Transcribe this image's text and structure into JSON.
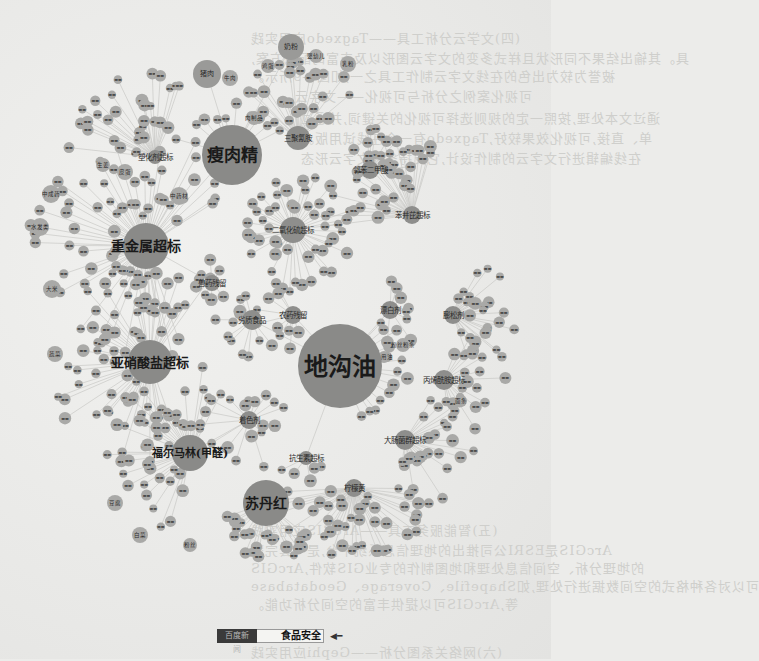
{
  "page": {
    "type": "scanned book page with food-safety keyword network graph",
    "background_color": "#ececea",
    "node_color": "#a9a9a7",
    "hub_color": "#8e8e8c",
    "edge_color": "#c9c9c6"
  },
  "bleed_through": {
    "note": "mirrored text from reverse side of the page",
    "lines": [
      {
        "text": "(四)文学云分析工具——Tagxedo应用实践",
        "x": 250,
        "y": 38
      },
      {
        "text": "具。其输出结果不同形状且样式多变的文字云图形以及丰富的配色方案,",
        "x": 250,
        "y": 58
      },
      {
        "text": "被誉为较为出色的在线文字云制作工具之一,如图1-9所示。",
        "x": 250,
        "y": 76
      },
      {
        "text": "可视化案例之分析与可视化——文字云。",
        "x": 280,
        "y": 96
      },
      {
        "text": "通过文本处理,按照一定的规则选择可视化的关键词,并通过",
        "x": 300,
        "y": 118
      },
      {
        "text": "单、直接,可视化效果较好,Tagxedo有一个在线试用版。",
        "x": 300,
        "y": 138
      },
      {
        "text": "在线编辑进行文字云的制作设计,它支持多种文字云形态",
        "x": 300,
        "y": 158
      },
      {
        "text": "(五)智能服务工具——ArcGIS应用实践",
        "x": 250,
        "y": 530
      },
      {
        "text": "ArcGIS是ESRI公司推出的地理信息系统平台,是一套完整",
        "x": 250,
        "y": 550
      },
      {
        "text": "的地理分析、空间信息处理和地图制作的专业GIS软件,ArcGIS",
        "x": 250,
        "y": 568
      },
      {
        "text": "可以对各种格式的空间数据进行处理,如Shapefile、Coverage、Geodatabase",
        "x": 250,
        "y": 586
      },
      {
        "text": "等,ArcGIS可以提供丰富的空间分析功能。",
        "x": 250,
        "y": 604
      },
      {
        "text": "(六)网络关系图分析——Gephi应用实践",
        "x": 250,
        "y": 652
      }
    ]
  },
  "graph": {
    "title_keyword": "食品安全",
    "hubs": [
      {
        "id": "dgy",
        "label": "地沟油",
        "x": 340,
        "y": 366,
        "r": 42,
        "size": "big",
        "font": 24
      },
      {
        "id": "srj",
        "label": "瘦肉精",
        "x": 232,
        "y": 155,
        "r": 30,
        "size": "big",
        "font": 17
      },
      {
        "id": "zjs",
        "label": "重金属超标",
        "x": 146,
        "y": 246,
        "r": 23,
        "size": "big",
        "font": 14
      },
      {
        "id": "xsy",
        "label": "亚硝酸盐超标",
        "x": 150,
        "y": 362,
        "r": 22,
        "size": "big",
        "font": 13
      },
      {
        "id": "fem",
        "label": "福尔马林(甲醛)",
        "x": 190,
        "y": 453,
        "r": 18,
        "size": "big",
        "font": 11
      },
      {
        "id": "sdh",
        "label": "苏丹红",
        "x": 266,
        "y": 503,
        "r": 23,
        "size": "big",
        "font": 14
      },
      {
        "id": "nf",
        "label": "奶粉",
        "x": 291,
        "y": 47,
        "r": 13,
        "size": "mid",
        "font": 8
      },
      {
        "id": "zr",
        "label": "猪肉",
        "x": 207,
        "y": 74,
        "r": 14,
        "size": "mid",
        "font": 8
      },
      {
        "id": "sjqa",
        "label": "三聚氰胺",
        "x": 298,
        "y": 138,
        "r": 12,
        "size": "hub",
        "font": 6
      },
      {
        "id": "eyh",
        "label": "二氧化硫超标",
        "x": 293,
        "y": 230,
        "r": 13,
        "size": "hub",
        "font": 6
      },
      {
        "id": "ptt",
        "label": "塑化剂超标",
        "x": 155,
        "y": 157,
        "r": 7,
        "size": "hub",
        "font": 4
      },
      {
        "id": "nng",
        "label": "邻苯二甲酸",
        "x": 370,
        "y": 170,
        "r": 9,
        "size": "hub",
        "font": 4
      },
      {
        "id": "bcj",
        "label": "苯并芘超标",
        "x": 412,
        "y": 215,
        "r": 9,
        "size": "hub",
        "font": 4
      },
      {
        "id": "jyd",
        "label": "劣质食品",
        "x": 252,
        "y": 320,
        "r": 10,
        "size": "hub",
        "font": 5
      },
      {
        "id": "mjj",
        "label": "漂白剂",
        "x": 390,
        "y": 310,
        "r": 9,
        "size": "hub",
        "font": 5
      },
      {
        "id": "gmj",
        "label": "膨松剂",
        "x": 453,
        "y": 315,
        "r": 9,
        "size": "hub",
        "font": 5
      },
      {
        "id": "bjd",
        "label": "丙烯酰胺超标",
        "x": 444,
        "y": 380,
        "r": 10,
        "size": "hub",
        "font": 4.5
      },
      {
        "id": "dcj",
        "label": "大肠菌群超标",
        "x": 405,
        "y": 440,
        "r": 10,
        "size": "hub",
        "font": 4.5
      },
      {
        "id": "zjf",
        "label": "着色剂",
        "x": 249,
        "y": 420,
        "r": 9,
        "size": "hub",
        "font": 5
      },
      {
        "id": "yyy",
        "label": "柠檬黄",
        "x": 354,
        "y": 488,
        "r": 9,
        "size": "hub",
        "font": 5
      },
      {
        "id": "nyc",
        "label": "农药残留",
        "x": 293,
        "y": 315,
        "r": 9,
        "size": "hub",
        "font": 5
      },
      {
        "id": "kzr",
        "label": "抗生素超标",
        "x": 306,
        "y": 458,
        "r": 7,
        "size": "hub",
        "font": 4
      },
      {
        "id": "xlj",
        "label": "兽药残留",
        "x": 212,
        "y": 283,
        "r": 8,
        "size": "hub",
        "font": 4
      }
    ],
    "named_satellites": [
      {
        "label": "牛肉",
        "x": 230,
        "y": 78,
        "r": 8
      },
      {
        "label": "鸡蛋",
        "x": 268,
        "y": 66,
        "r": 7
      },
      {
        "label": "乳粉",
        "x": 348,
        "y": 64,
        "r": 8
      },
      {
        "label": "婴幼儿",
        "x": 316,
        "y": 56,
        "r": 7
      },
      {
        "label": "肉制品",
        "x": 254,
        "y": 118,
        "r": 7
      },
      {
        "label": "中成药",
        "x": 51,
        "y": 194,
        "r": 9
      },
      {
        "label": "中药材",
        "x": 179,
        "y": 196,
        "r": 9
      },
      {
        "label": "水发类",
        "x": 40,
        "y": 227,
        "r": 9
      },
      {
        "label": "大米",
        "x": 52,
        "y": 289,
        "r": 9
      },
      {
        "label": "皮蛋",
        "x": 125,
        "y": 172,
        "r": 8
      },
      {
        "label": "生姜",
        "x": 103,
        "y": 165,
        "r": 7
      },
      {
        "label": "蔬菜",
        "x": 55,
        "y": 354,
        "r": 8
      },
      {
        "label": "白菜",
        "x": 140,
        "y": 535,
        "r": 8
      },
      {
        "label": "豆腐",
        "x": 115,
        "y": 503,
        "r": 8
      },
      {
        "label": "粉丝",
        "x": 190,
        "y": 545,
        "r": 7
      },
      {
        "label": "粉丝粉条",
        "x": 403,
        "y": 345,
        "r": 7
      },
      {
        "label": "食用油",
        "x": 384,
        "y": 357,
        "r": 6
      },
      {
        "label": "面条",
        "x": 461,
        "y": 401,
        "r": 6
      }
    ],
    "tiny_node_count_estimate": 420
  },
  "searchbar": {
    "tab_label": "百度新闻",
    "query": "食品安全",
    "arrow_icon": "arrow-left-icon"
  }
}
